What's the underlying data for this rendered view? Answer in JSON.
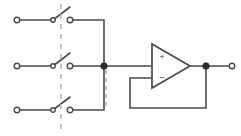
{
  "diagram": {
    "type": "schematic",
    "background_color": "#ffffff",
    "wire_color": "#4a4a4a",
    "node_color": "#2b2b2b",
    "linkage_color": "#b9b9b9",
    "width": 241,
    "height": 136
  },
  "opamp": {
    "name": "operational-amplifier",
    "configuration": "voltage-follower",
    "plus_label": "+",
    "minus_label": "–",
    "triangle": {
      "x1": 152,
      "y_top": 44,
      "y_bottom": 88,
      "x_tip": 190,
      "y_tip": 66
    },
    "plus_input_y": 58,
    "minus_input_y": 78,
    "output_x": 190,
    "output_y": 66
  },
  "switches": [
    {
      "name": "switch-pole-1",
      "state": "open",
      "row_y": 20,
      "left_terminal_x": 17,
      "pivot_x": 53,
      "blade_end_x": 68,
      "blade_end_y": 8,
      "right_terminal_x": 70
    },
    {
      "name": "switch-pole-2",
      "state": "open",
      "row_y": 66,
      "left_terminal_x": 17,
      "pivot_x": 53,
      "blade_end_x": 68,
      "blade_end_y": 54,
      "right_terminal_x": 70
    },
    {
      "name": "switch-pole-3",
      "state": "open",
      "row_y": 110,
      "left_terminal_x": 17,
      "pivot_x": 53,
      "blade_end_x": 68,
      "blade_end_y": 98,
      "right_terminal_x": 70
    }
  ],
  "linkage": {
    "name": "mechanical-ganging-line",
    "x": 61,
    "y_top": 4,
    "y_bottom": 132,
    "style": "dashed"
  },
  "linkage_secondary": {
    "name": "secondary-dashed-line",
    "x": 106,
    "y_top": 70,
    "y_bottom": 108,
    "style": "dashed"
  },
  "nodes": [
    {
      "name": "summing-junction-node",
      "x": 104,
      "y": 66,
      "radius": 3.2
    },
    {
      "name": "output-node",
      "x": 206,
      "y": 66,
      "radius": 3.2
    }
  ],
  "terminals": [
    {
      "name": "input-terminal-1-left",
      "x": 17,
      "y": 20,
      "radius": 2.8
    },
    {
      "name": "input-terminal-2-left",
      "x": 17,
      "y": 66,
      "radius": 2.8
    },
    {
      "name": "input-terminal-3-left",
      "x": 17,
      "y": 110,
      "radius": 2.8
    },
    {
      "name": "pole-terminal-1-right",
      "x": 70,
      "y": 20,
      "radius": 2.8
    },
    {
      "name": "pole-terminal-2-right",
      "x": 70,
      "y": 66,
      "radius": 2.8
    },
    {
      "name": "pole-terminal-3-right",
      "x": 70,
      "y": 110,
      "radius": 2.8
    },
    {
      "name": "output-terminal",
      "x": 232,
      "y": 66,
      "radius": 2.8
    }
  ],
  "wires": {
    "input_lead_1": "M 19 20 L 52 20",
    "input_lead_2": "M 19 66 L 52 66",
    "input_lead_3": "M 19 110 L 52 110",
    "top_bus": "M 72 20 L 104 20 L 104 66",
    "middle_bus": "M 72 66 L 152 66",
    "bottom_bus": "M 72 110 L 104 110 L 104 66",
    "opamp_to_output": "M 190 66 L 230 66",
    "feedback_path": "M 152 78 L 130 78 L 130 108 L 206 108 L 206 66"
  },
  "switch_blades": {
    "blade_1": "M 53 20 L 70 7",
    "blade_2": "M 53 66 L 70 53",
    "blade_3": "M 53 110 L 70 97"
  },
  "pivots": [
    {
      "name": "pivot-1",
      "x": 53,
      "y": 20,
      "radius": 2.2
    },
    {
      "name": "pivot-2",
      "x": 53,
      "y": 66,
      "radius": 2.2
    },
    {
      "name": "pivot-3",
      "x": 53,
      "y": 110,
      "radius": 2.2
    }
  ]
}
